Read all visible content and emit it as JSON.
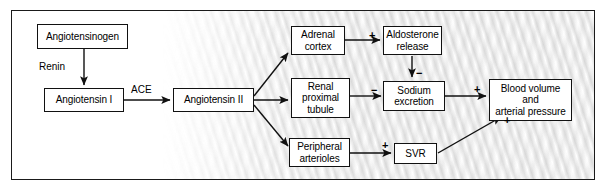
{
  "diagram": {
    "frame_border_color": "#1a1a1a",
    "nodes": [
      {
        "id": "angiotensinogen",
        "label": "Angiotensinogen"
      },
      {
        "id": "angiotensin_i",
        "label": "Angiotensin I"
      },
      {
        "id": "angiotensin_ii",
        "label": "Angiotensin II"
      },
      {
        "id": "adrenal_cortex",
        "label": "Adrenal\ncortex"
      },
      {
        "id": "renal_proximal_tubule",
        "label": "Renal\nproximal\ntubule"
      },
      {
        "id": "peripheral_arterioles",
        "label": "Peripheral\narterioles"
      },
      {
        "id": "aldosterone_release",
        "label": "Aldosterone\nrelease"
      },
      {
        "id": "sodium_excretion",
        "label": "Sodium\nexcretion"
      },
      {
        "id": "svr",
        "label": "SVR"
      },
      {
        "id": "blood_volume",
        "label": "Blood volume\nand\narterial pressure"
      }
    ],
    "edge_labels": [
      {
        "id": "renin",
        "text": "Renin"
      },
      {
        "id": "ace",
        "text": "ACE"
      }
    ],
    "signs": [
      {
        "id": "sign-adrenal-aldosterone",
        "text": "+"
      },
      {
        "id": "sign-aldosterone-sodium",
        "text": "−"
      },
      {
        "id": "sign-tubule-sodium",
        "text": "−"
      },
      {
        "id": "sign-sodium-bloodvolume",
        "text": "+"
      },
      {
        "id": "sign-arterioles-svr",
        "text": "+"
      },
      {
        "id": "sign-svr-bloodvolume",
        "text": "+"
      }
    ]
  }
}
